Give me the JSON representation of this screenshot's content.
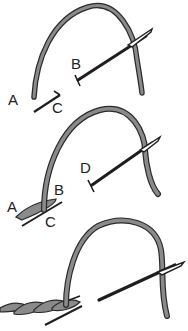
{
  "diagram": {
    "type": "stem-stitch-steps",
    "steps": [
      {
        "index": 1,
        "labels": [
          {
            "id": "A",
            "text": "A",
            "x": 12,
            "y": 95
          },
          {
            "id": "C",
            "text": "C",
            "x": 54,
            "y": 100
          },
          {
            "id": "B",
            "text": "B",
            "x": 71,
            "y": 58
          }
        ]
      },
      {
        "index": 2,
        "labels": [
          {
            "id": "A",
            "text": "A",
            "x": 8,
            "y": 200
          },
          {
            "id": "B",
            "text": "B",
            "x": 55,
            "y": 182
          },
          {
            "id": "C",
            "text": "C",
            "x": 46,
            "y": 213
          },
          {
            "id": "D",
            "text": "D",
            "x": 80,
            "y": 163
          }
        ]
      },
      {
        "index": 3,
        "labels": []
      }
    ],
    "colors": {
      "thread_fill": "#8a8a8a",
      "thread_outline": "#2a2a2a",
      "needle": "#1e1e1e",
      "fabric_line": "#1e1e1e",
      "background": "#ffffff"
    }
  }
}
